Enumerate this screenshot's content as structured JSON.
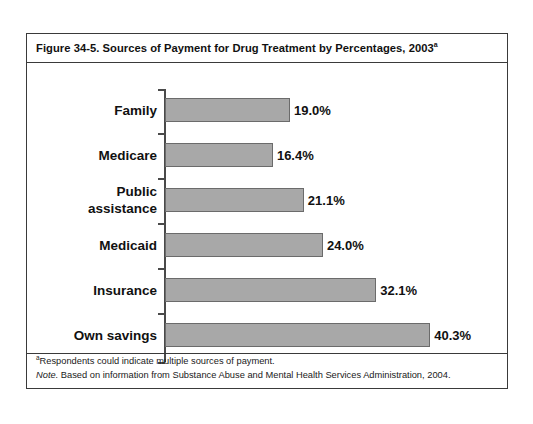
{
  "figure": {
    "title": "Figure 34-5. Sources of Payment for Drug Treatment by Percentages, 2003",
    "title_superscript": "a",
    "footnote_marker": "a",
    "footnote_text": "Respondents could indicate multiple sources of payment.",
    "note_label": "Note.",
    "note_text": " Based on information from Substance Abuse and Mental Health Services Administration, 2004."
  },
  "chart_data": {
    "type": "bar",
    "orientation": "horizontal",
    "title": "Figure 34-5. Sources of Payment for Drug Treatment by Percentages, 2003",
    "xlabel": "",
    "ylabel": "",
    "grid": false,
    "legend": "none",
    "xlim": [
      0,
      40.3
    ],
    "categories": [
      "Family",
      "Medicare",
      "Public assistance",
      "Medicaid",
      "Insurance",
      "Own savings"
    ],
    "values": [
      19.0,
      16.4,
      21.1,
      24.0,
      32.1,
      40.3
    ],
    "value_labels": [
      "19.0%",
      "16.4%",
      "21.1%",
      "24.0%",
      "32.1%",
      "40.3%"
    ],
    "category_lines": [
      [
        "Family"
      ],
      [
        "Medicare"
      ],
      [
        "Public",
        "assistance"
      ],
      [
        "Medicaid"
      ],
      [
        "Insurance"
      ],
      [
        "Own savings"
      ]
    ],
    "bar_color": "#a8a8a8",
    "bar_border_color": "#6b6b6b",
    "axis_color": "#4a4a4a"
  }
}
